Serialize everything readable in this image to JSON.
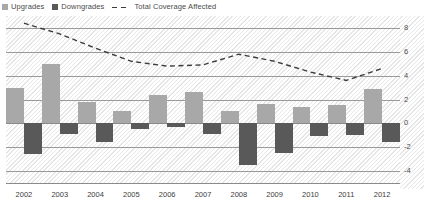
{
  "legend": {
    "items": [
      {
        "label": "Upgrades",
        "type": "swatch",
        "color": "#a8a8a8"
      },
      {
        "label": "Downgrades",
        "type": "swatch",
        "color": "#595959"
      },
      {
        "label": "Total Coverage Affected",
        "type": "dashed-line",
        "color": "#3c3c3c"
      }
    ]
  },
  "chart_data": {
    "type": "bar",
    "title": "",
    "xlabel": "",
    "ylabel": "",
    "ylim": [
      -5,
      9
    ],
    "yticks": [
      8,
      6,
      4,
      2,
      0,
      -2,
      -4
    ],
    "ytick_labels": [
      "8",
      "6",
      "4",
      "2",
      "0",
      "-2",
      "-4"
    ],
    "grid": true,
    "legend_position": "top-left",
    "categories": [
      "2002",
      "2003",
      "2004",
      "2005",
      "2006",
      "2007",
      "2008",
      "2009",
      "2010",
      "2011",
      "2012"
    ],
    "series": [
      {
        "name": "Upgrades",
        "color": "#a8a8a8",
        "values": [
          3.0,
          5.0,
          1.8,
          1.0,
          2.4,
          2.6,
          1.0,
          1.6,
          1.4,
          1.5,
          2.9
        ]
      },
      {
        "name": "Downgrades",
        "color": "#595959",
        "values": [
          -2.6,
          -0.9,
          -1.6,
          -0.5,
          -0.3,
          -0.9,
          -3.5,
          -2.5,
          -1.1,
          -1.0,
          -1.6
        ]
      }
    ],
    "line_series": {
      "name": "Total Coverage Affected",
      "color": "#3c3c3c",
      "style": "dashed",
      "values": [
        8.4,
        7.5,
        6.3,
        5.2,
        4.8,
        4.9,
        5.8,
        5.2,
        4.3,
        3.6,
        4.6
      ]
    }
  },
  "axes": {
    "x_labels": [
      "2002",
      "2003",
      "2004",
      "2005",
      "2006",
      "2007",
      "2008",
      "2009",
      "2010",
      "2011",
      "2012"
    ]
  }
}
